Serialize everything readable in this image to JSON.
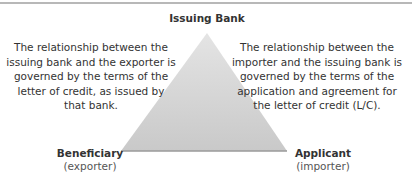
{
  "diagram": {
    "type": "relationship-triangle",
    "colors": {
      "triangle_fill_top": "#e2e2e2",
      "triangle_fill_bottom": "#c8c8c8",
      "triangle_base_edge": "#9a9a9a",
      "top_rule": "#b8b8b8",
      "text": "#333333"
    },
    "nodes": {
      "top": {
        "title": "Issuing Bank"
      },
      "bottom_left": {
        "title": "Beneficiary",
        "subtitle": "(exporter)"
      },
      "bottom_right": {
        "title": "Applicant",
        "subtitle": "(importer)"
      }
    },
    "descriptions": {
      "left": "The relationship between the issuing bank and the exporter is governed by the terms of the letter of credit, as issued by that bank.",
      "right": "The relationship between the importer and the issuing bank is governed by the terms of the application and agreement for the letter of credit (L/C)."
    }
  }
}
